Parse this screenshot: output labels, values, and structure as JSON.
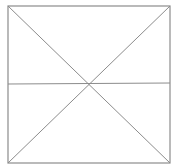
{
  "diagram": {
    "stroke_color": "#8c8c8c",
    "background": "#ffffff",
    "square": {
      "x1": 8,
      "y1": 6,
      "x2": 170,
      "y2": 163
    },
    "lines": [
      {
        "name": "diagonal-tl-br",
        "x1": 8,
        "y1": 6,
        "x2": 170,
        "y2": 163
      },
      {
        "name": "diagonal-tr-bl",
        "x1": 170,
        "y1": 6,
        "x2": 8,
        "y2": 163
      },
      {
        "name": "horizontal-midline",
        "x1": 8,
        "y1": 84,
        "x2": 170,
        "y2": 83
      }
    ]
  }
}
